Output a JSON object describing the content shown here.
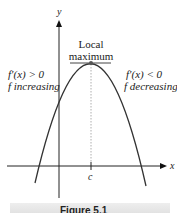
{
  "diagram": {
    "axes": {
      "x_label": "x",
      "y_label": "y",
      "tick_label": "c"
    },
    "annotations": {
      "peak_line1": "Local",
      "peak_line2": "maximum",
      "left_line1": "f′(x) > 0",
      "left_line2": "f increasing",
      "right_line1": "f′(x) < 0",
      "right_line2": "f decreasing"
    },
    "caption": "Figure 5.1"
  },
  "colors": {
    "curve": "#333333",
    "axis": "#222222",
    "point": "#555555",
    "caption_bg": "#e6e6e6"
  }
}
